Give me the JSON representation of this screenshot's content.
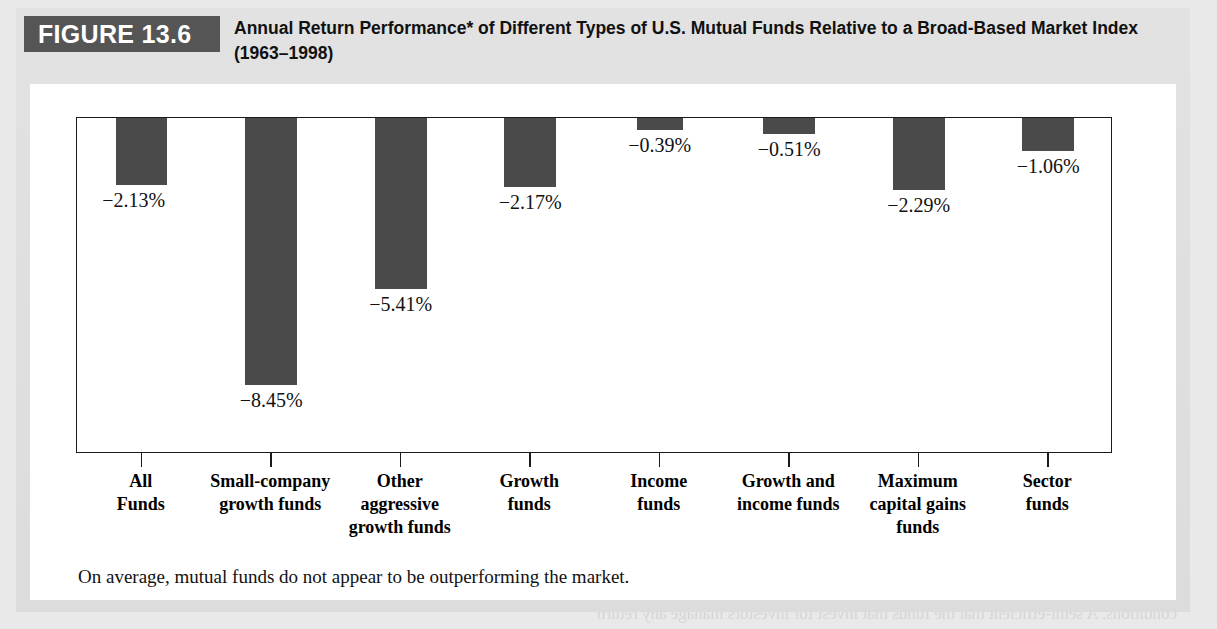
{
  "figure": {
    "badge_label": "FIGURE 13.6",
    "title": "Annual Return Performance* of Different Types of U.S. Mutual Funds Relative to a Broad-Based Market Index (1963–1998)",
    "caption": "On average, mutual funds do not appear to be outperforming the market.",
    "badge_bg": "#555555",
    "badge_fg": "#ffffff",
    "bar_color": "#4a4a4a",
    "panel_bg": "#ffffff",
    "band_bg": "#dedede"
  },
  "chart_data": {
    "type": "bar",
    "title": "Annual Return Performance* of Different Types of U.S. Mutual Funds Relative to a Broad-Based Market Index (1963–1998)",
    "xlabel": "",
    "ylabel": "",
    "ylim": [
      -9.0,
      0
    ],
    "grid": false,
    "legend": "none",
    "orientation": "vertical-downward-from-zero-line",
    "categories": [
      "All Funds",
      "Small-company growth funds",
      "Other aggressive growth funds",
      "Growth funds",
      "Income funds",
      "Growth and income funds",
      "Maximum capital gains funds",
      "Sector funds"
    ],
    "category_lines": [
      [
        "All",
        "Funds"
      ],
      [
        "Small-company",
        "growth funds"
      ],
      [
        "Other",
        "aggressive",
        "growth funds"
      ],
      [
        "Growth",
        "funds"
      ],
      [
        "Income",
        "funds"
      ],
      [
        "Growth and",
        "income funds"
      ],
      [
        "Maximum",
        "capital gains",
        "funds"
      ],
      [
        "Sector",
        "funds"
      ]
    ],
    "values": [
      -2.13,
      -8.45,
      -5.41,
      -2.17,
      -0.39,
      -0.51,
      -2.29,
      -1.06
    ],
    "data_labels": [
      "−2.13%",
      "−8.45%",
      "−5.41%",
      "−2.17%",
      "−0.39%",
      "−0.51%",
      "−2.29%",
      "−1.06%"
    ]
  },
  "ghost_text": [
    "ability has access to all information that is accessible to the management",
    "uninformed. They should sound sophisticated to retain the",
    "to sound to believe they might learn their management ability by",
    "examining the record of each. There is some evidence that it does do that",
    "number of studies suggest the value of these funds are substantially overperform",
    "Short-term efficient does not seem to be outperforming by these reasons.",
    "13.5  The Behavioral Challenge to Market Efficiency",
    "In Section 13.2 we presented that 'efficiency' arose conditions, one or two of which will be",
    "not sufficient in the literature. In the first, we can argue for the third lesson, we can note",
    "that investors be not rational; Even more, how efficiency is defined, aggregate? We have seen",
    "that market prices would not be argued to be rational forever. It is argued that these two",
    "are necessary likely to hold in time. This point of view and then refer to tenets behind the",
    "\"behavioral\" literature examining the",
    "conditions. A semi-efficient that the funds that invest for investors manage any return"
  ]
}
